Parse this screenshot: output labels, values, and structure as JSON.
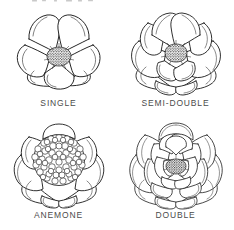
{
  "figure": {
    "background_color": "#ffffff",
    "ink_color": "#1a1a1a",
    "label_color": "#4b4b4b",
    "layout": "2x2 grid of botanical line drawings with captions",
    "top_edge_fragment": "partial clipped text at top edge"
  },
  "flowers": [
    {
      "id": "single",
      "label": "SINGLE",
      "position": "top-left",
      "petal_rows": 1,
      "petal_count": 5,
      "center_type": "stamen-cluster",
      "center_size": "small",
      "icon": "single-flower-icon"
    },
    {
      "id": "semi-double",
      "label": "SEMI-DOUBLE",
      "position": "top-right",
      "petal_rows": 2,
      "petal_count": 11,
      "center_type": "stamen-cluster",
      "center_size": "small",
      "icon": "semi-double-flower-icon"
    },
    {
      "id": "anemone",
      "label": "ANEMONE",
      "position": "bottom-left",
      "petal_rows": 2,
      "petal_count": 10,
      "center_type": "petaloid-mass",
      "center_size": "large",
      "icon": "anemone-flower-icon"
    },
    {
      "id": "double",
      "label": "DOUBLE",
      "position": "bottom-right",
      "petal_rows": 4,
      "petal_count": 26,
      "center_type": "stamen-cluster",
      "center_size": "small",
      "icon": "double-flower-icon"
    }
  ]
}
